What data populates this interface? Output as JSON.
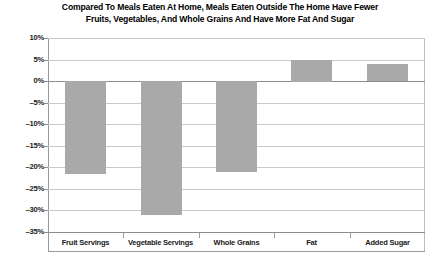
{
  "chart_data": {
    "type": "bar",
    "title": "Compared To Meals Eaten At Home, Meals Eaten Outside The Home Have Fewer Fruits, Vegetables, And Whole Grains And Have More Fat And Sugar",
    "title_lines": [
      "Compared To Meals Eaten At Home, Meals Eaten Outside The Home Have Fewer",
      "Fruits, Vegetables, And Whole Grains And Have More Fat And Sugar"
    ],
    "categories": [
      "Fruit Servings",
      "Vegetable Servings",
      "Whole Grains",
      "Fat",
      "Added Sugar"
    ],
    "values": [
      -21.5,
      -31,
      -21,
      5,
      4
    ],
    "value_labels": [
      "-21.5%",
      "-31%",
      "-21%",
      "5%",
      "4%"
    ],
    "xlabel": "",
    "ylabel": "",
    "ylim": [
      -35,
      10
    ],
    "ytick_values": [
      10,
      5,
      0,
      -5,
      -10,
      -15,
      -20,
      -25,
      -30,
      -35
    ],
    "ytick_labels": [
      "10%",
      "5%",
      "0%",
      "-5%",
      "-10%",
      "-15%",
      "-20%",
      "-25%",
      "-30%",
      "-35%"
    ],
    "grid": true,
    "legend": false,
    "bar_color": "#a9a9a9",
    "gridline_color": "#c9c9c9",
    "axis_color": "#8d8d8d",
    "text_color": "#1a1a1a",
    "background_color": "#ffffff"
  }
}
